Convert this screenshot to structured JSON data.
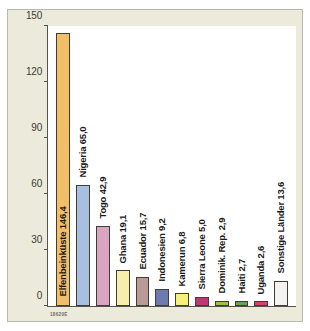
{
  "figure": {
    "title_line1": "Rohkakaolieferländer",
    "title_line2": "Deutschlands",
    "subtitle": "Importe 2010 in 1000 Tonnen",
    "source_code": "18620E",
    "background_color": "#eceadb",
    "panel_color": "#ffffff",
    "axis_color": "#55534c"
  },
  "chart_data": {
    "type": "bar",
    "title": "Rohkakaolieferländer Deutschlands",
    "subtitle": "Importe 2010 in 1000 Tonnen",
    "xlabel": "",
    "ylabel": "",
    "ylim": [
      0,
      150
    ],
    "yticks": [
      0,
      30,
      60,
      90,
      120,
      150
    ],
    "grid": false,
    "legend": "none",
    "unit": "1000 Tonnen",
    "categories": [
      "Elfenbeinküste",
      "Nigeria",
      "Togo",
      "Ghana",
      "Ecuador",
      "Indonesien",
      "Kamerun",
      "Sierra Leone",
      "Dominik. Rep.",
      "Haiti",
      "Uganda",
      "Sonstige Länder"
    ],
    "values": [
      146.4,
      65.0,
      42.9,
      19.1,
      15.7,
      9.2,
      6.8,
      5.0,
      2.9,
      2.7,
      2.6,
      13.6
    ],
    "value_labels": [
      "146,4",
      "65,0",
      "42,9",
      "19,1",
      "15,7",
      "9,2",
      "6,8",
      "5,0",
      "2,9",
      "2,7",
      "2,6",
      "13,6"
    ],
    "bar_labels": [
      "Elfenbeinküste 146,4",
      "Nigeria 65,0",
      "Togo 42,9",
      "Ghana 19,1",
      "Ecuador 15,7",
      "Indonesien 9,2",
      "Kamerun 6,8",
      "Sierra Leone 5,0",
      "Dominik. Rep. 2,9",
      "Haiti 2,7",
      "Uganda 2,6",
      "Sonstige Länder 13,6"
    ],
    "colors": [
      "#f2bf68",
      "#a8bfdf",
      "#dba4bf",
      "#f7eeab",
      "#b99a94",
      "#6f7bb0",
      "#f6f07a",
      "#bb3a74",
      "#9cc23f",
      "#61a84d",
      "#d94168",
      "#f4f3ef"
    ]
  }
}
